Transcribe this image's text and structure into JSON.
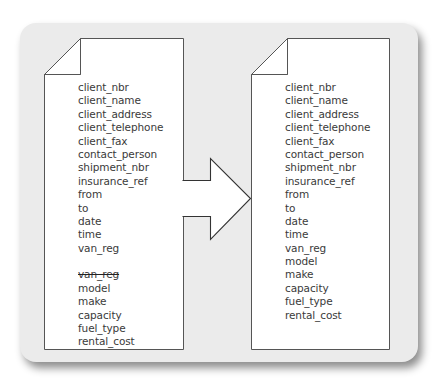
{
  "diagram": {
    "colors": {
      "panel_background": "#ebebeb",
      "document_fill": "#ffffff",
      "outline": "#555555",
      "text": "#3a3a3a"
    },
    "left_document": {
      "fields": [
        {
          "label": "client_nbr"
        },
        {
          "label": "client_name"
        },
        {
          "label": "client_address"
        },
        {
          "label": "client_telephone"
        },
        {
          "label": "client_fax"
        },
        {
          "label": "contact_person"
        },
        {
          "label": "shipment_nbr"
        },
        {
          "label": "insurance_ref"
        },
        {
          "label": "from"
        },
        {
          "label": "to"
        },
        {
          "label": "date"
        },
        {
          "label": "time"
        },
        {
          "label": "van_reg"
        },
        {
          "label": "",
          "gap": true
        },
        {
          "label": "van_reg",
          "struck": true
        },
        {
          "label": "model"
        },
        {
          "label": "make"
        },
        {
          "label": "capacity"
        },
        {
          "label": "fuel_type"
        },
        {
          "label": "rental_cost"
        }
      ]
    },
    "arrow": {
      "direction": "right",
      "meaning": "transforms-to"
    },
    "right_document": {
      "fields": [
        {
          "label": "client_nbr"
        },
        {
          "label": "client_name"
        },
        {
          "label": "client_address"
        },
        {
          "label": "client_telephone"
        },
        {
          "label": "client_fax"
        },
        {
          "label": "contact_person"
        },
        {
          "label": "shipment_nbr"
        },
        {
          "label": "insurance_ref"
        },
        {
          "label": "from"
        },
        {
          "label": "to"
        },
        {
          "label": "date"
        },
        {
          "label": "time"
        },
        {
          "label": "van_reg"
        },
        {
          "label": "model"
        },
        {
          "label": "make"
        },
        {
          "label": "capacity"
        },
        {
          "label": "fuel_type"
        },
        {
          "label": "rental_cost"
        }
      ]
    }
  }
}
